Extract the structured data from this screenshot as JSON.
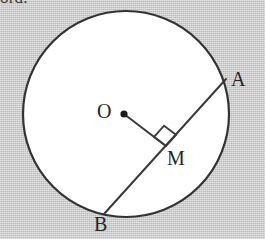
{
  "figure": {
    "kind": "geometry-diagram",
    "width": 265,
    "height": 239,
    "background_color": "#c9c9c9",
    "circle_fill": "#ffffff",
    "stroke_color": "#333333"
  },
  "cropped_caption": {
    "text": "ord.",
    "note": "bottom sliver of a text line cut off at the top edge of the crop"
  },
  "labels": {
    "center": "O",
    "chord_end_upper_right": "A",
    "chord_end_lower_left": "B",
    "foot_of_perpendicular": "M"
  },
  "geometry": {
    "circle": {
      "cx": 126,
      "cy": 114,
      "r": 103
    },
    "center_point": {
      "x": 124,
      "y": 114,
      "dot_radius": 3.6
    },
    "chord": {
      "name": "AB",
      "from": {
        "label": "A",
        "x": 226,
        "y": 79
      },
      "to": {
        "label": "B",
        "x": 104,
        "y": 214
      }
    },
    "radius_segment": {
      "name": "OM",
      "from": {
        "label": "O",
        "x": 124,
        "y": 114
      },
      "to": {
        "label": "M",
        "x": 166,
        "y": 146
      }
    },
    "right_angle_marker": {
      "at": "M",
      "size": 15,
      "angle_degrees": 90
    }
  }
}
